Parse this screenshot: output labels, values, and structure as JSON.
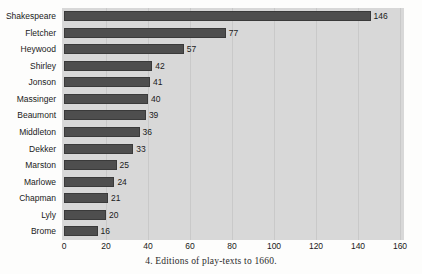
{
  "caption": "4. Editions of play-texts to 1660.",
  "colors": {
    "page_background": "#fdfdfc",
    "plot_background": "#d8d8d8",
    "bar_fill": "#4e4e4e",
    "gridline": "#c9c9c9",
    "text": "#1a1a1a"
  },
  "chart_data": {
    "type": "bar",
    "orientation": "horizontal",
    "title": "",
    "subtitle": "",
    "xlabel": "",
    "ylabel": "",
    "categories": [
      "Shakespeare",
      "Fletcher",
      "Heywood",
      "Shirley",
      "Jonson",
      "Massinger",
      "Beaumont",
      "Middleton",
      "Dekker",
      "Marston",
      "Marlowe",
      "Chapman",
      "Lyly",
      "Brome"
    ],
    "values": [
      146,
      77,
      57,
      42,
      41,
      40,
      39,
      36,
      33,
      25,
      24,
      21,
      20,
      16
    ],
    "data_labels": [
      "146",
      "77",
      "57",
      "42",
      "41",
      "40",
      "39",
      "36",
      "33",
      "25",
      "24",
      "21",
      "20",
      "16"
    ],
    "xlim": [
      0,
      160
    ],
    "xticks": [
      0,
      20,
      40,
      60,
      80,
      100,
      120,
      140,
      160
    ],
    "xtick_labels": [
      "0",
      "20",
      "40",
      "60",
      "80",
      "100",
      "120",
      "140",
      "160"
    ],
    "grid": true,
    "grid_axis": "x",
    "legend": false,
    "legend_position": "none"
  }
}
